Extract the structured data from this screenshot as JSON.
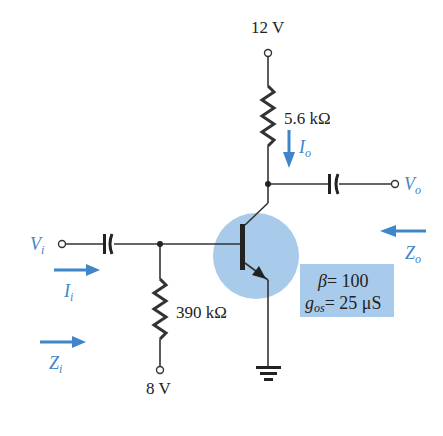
{
  "colors": {
    "wire": "#333333",
    "accent_blue": "#3f86c8",
    "transistor_highlight": "#a9cbeb",
    "param_box": "#a9cbeb"
  },
  "supply": {
    "vcc_label": "12 V",
    "vbb_label": "8 V"
  },
  "components": {
    "rc": {
      "label": "5.6 kΩ"
    },
    "rb": {
      "label": "390 kΩ"
    }
  },
  "labels": {
    "vi_main": "V",
    "vi_sub": "i",
    "vo_main": "V",
    "vo_sub": "o",
    "ii_main": "I",
    "ii_sub": "i",
    "io_main": "I",
    "io_sub": "o",
    "zi_main": "Z",
    "zi_sub": "i",
    "zo_main": "Z",
    "zo_sub": "o"
  },
  "parameters": {
    "beta_symbol": "β",
    "beta_value": "= 100",
    "gos_main": "g",
    "gos_sub": "os",
    "gos_value": "= 25 μS"
  }
}
